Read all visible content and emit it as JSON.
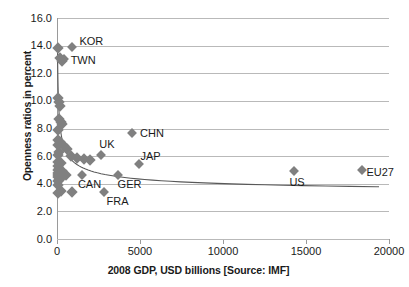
{
  "chart_data": {
    "type": "scatter",
    "title": "",
    "xlabel": "2008 GDP, USD billions [Source: IMF]",
    "ylabel": "Openness ratios in percent",
    "xlim": [
      0,
      20000
    ],
    "ylim": [
      0,
      16
    ],
    "xticks": [
      "0",
      "5000",
      "10000",
      "15000",
      "20000"
    ],
    "xtick_values": [
      0,
      5000,
      10000,
      15000,
      20000
    ],
    "yticks": [
      "0.0",
      "2.0",
      "4.0",
      "6.0",
      "8.0",
      "10.0",
      "12.0",
      "14.0",
      "16.0"
    ],
    "ytick_values": [
      0,
      2,
      4,
      6,
      8,
      10,
      12,
      14,
      16
    ],
    "grid": "horizontal",
    "legend": "none",
    "marker_color": "#808080",
    "marker_shape": "diamond",
    "trendline": "power-decay",
    "trendline_color": "#595959",
    "points": [
      {
        "label": "KOR",
        "x": 930,
        "y": 13.9
      },
      {
        "label": "TWN",
        "x": 400,
        "y": 13.0
      },
      {
        "label": "CHN",
        "x": 4520,
        "y": 7.7
      },
      {
        "label": "UK",
        "x": 2670,
        "y": 6.1
      },
      {
        "label": "JAP",
        "x": 4910,
        "y": 5.4
      },
      {
        "label": "CAN",
        "x": 1500,
        "y": 4.6
      },
      {
        "label": "GER",
        "x": 3650,
        "y": 4.6
      },
      {
        "label": "FRA",
        "x": 2860,
        "y": 3.4
      },
      {
        "label": "US",
        "x": 14300,
        "y": 4.9
      },
      {
        "label": "EU27",
        "x": 18400,
        "y": 5.0
      }
    ],
    "unlabeled_points": [
      {
        "x": 60,
        "y": 13.8
      },
      {
        "x": 190,
        "y": 13.1
      },
      {
        "x": 330,
        "y": 12.9
      },
      {
        "x": 70,
        "y": 10.2
      },
      {
        "x": 110,
        "y": 9.9
      },
      {
        "x": 200,
        "y": 9.6
      },
      {
        "x": 130,
        "y": 8.7
      },
      {
        "x": 250,
        "y": 8.5
      },
      {
        "x": 300,
        "y": 8.3
      },
      {
        "x": 90,
        "y": 7.9
      },
      {
        "x": 60,
        "y": 7.2
      },
      {
        "x": 170,
        "y": 7.0
      },
      {
        "x": 40,
        "y": 6.8
      },
      {
        "x": 420,
        "y": 6.7
      },
      {
        "x": 620,
        "y": 6.5
      },
      {
        "x": 110,
        "y": 6.3
      },
      {
        "x": 80,
        "y": 6.1
      },
      {
        "x": 830,
        "y": 6.0
      },
      {
        "x": 1180,
        "y": 5.9
      },
      {
        "x": 1600,
        "y": 5.8
      },
      {
        "x": 2000,
        "y": 5.7
      },
      {
        "x": 50,
        "y": 5.6
      },
      {
        "x": 240,
        "y": 5.5
      },
      {
        "x": 60,
        "y": 5.3
      },
      {
        "x": 150,
        "y": 5.1
      },
      {
        "x": 70,
        "y": 5.0
      },
      {
        "x": 330,
        "y": 4.9
      },
      {
        "x": 40,
        "y": 4.8
      },
      {
        "x": 190,
        "y": 4.7
      },
      {
        "x": 90,
        "y": 4.6
      },
      {
        "x": 560,
        "y": 4.6
      },
      {
        "x": 60,
        "y": 4.5
      },
      {
        "x": 260,
        "y": 4.4
      },
      {
        "x": 120,
        "y": 4.3
      },
      {
        "x": 50,
        "y": 4.2
      },
      {
        "x": 80,
        "y": 3.9
      },
      {
        "x": 230,
        "y": 3.5
      },
      {
        "x": 900,
        "y": 3.4
      },
      {
        "x": 60,
        "y": 3.3
      }
    ]
  }
}
